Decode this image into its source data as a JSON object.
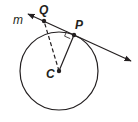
{
  "diagram": {
    "type": "geometry",
    "colors": {
      "stroke": "#231f20",
      "background": "#ffffff"
    },
    "labels": {
      "line": "m",
      "tangent_point": "P",
      "external_point": "Q",
      "center": "C"
    },
    "elements": {
      "circle": {
        "center": "C",
        "cx": 59,
        "cy": 71,
        "r": 39
      },
      "tangent_line": {
        "name": "m",
        "through": [
          "Q",
          "P"
        ],
        "arrows": "both"
      },
      "radius": {
        "from": "C",
        "to": "P",
        "style": "solid"
      },
      "segment": {
        "from": "C",
        "to": "Q",
        "style": "dashed"
      },
      "right_angle_mark": {
        "at": "P"
      }
    }
  }
}
